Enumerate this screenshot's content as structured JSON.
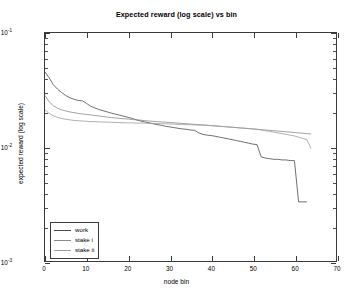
{
  "chart_data": {
    "type": "line",
    "title": "Expected reward (log scale) vs bin",
    "xlabel": "node bin",
    "ylabel": "expected reward (log scale)",
    "yscale": "log",
    "xscale": "linear",
    "xlim": [
      0,
      70
    ],
    "ylim": [
      0.001,
      0.1
    ],
    "grid": false,
    "xticks": [
      "0",
      "10",
      "20",
      "30",
      "40",
      "50",
      "60",
      "70"
    ],
    "xtick_values": [
      0,
      10,
      20,
      30,
      40,
      50,
      60,
      70
    ],
    "ytick_labels": [
      "10",
      "10",
      "10"
    ],
    "ytick_exponents": [
      "-1",
      "-2",
      "-3"
    ],
    "ytick_values": [
      0.1,
      0.01,
      0.001
    ],
    "legend_position": "lower left",
    "series": [
      {
        "name": "work",
        "color": "#4a4a4a",
        "x": [
          0,
          1,
          2,
          3,
          4,
          5,
          6,
          7,
          8,
          9,
          10,
          11,
          12,
          13,
          14,
          15,
          16,
          17,
          18,
          19,
          20,
          21,
          22,
          23,
          24,
          25,
          26,
          27,
          28,
          29,
          30,
          31,
          32,
          33,
          34,
          35,
          36,
          37,
          38,
          39,
          40,
          41,
          42,
          43,
          44,
          45,
          46,
          47,
          48,
          49,
          50,
          51,
          52,
          53,
          54,
          55,
          56,
          57,
          58,
          59,
          60,
          61,
          62,
          63
        ],
        "values": [
          0.0455,
          0.0404,
          0.0352,
          0.0322,
          0.03,
          0.0283,
          0.027,
          0.0262,
          0.0256,
          0.0254,
          0.0241,
          0.0228,
          0.022,
          0.0213,
          0.0208,
          0.0203,
          0.0198,
          0.0194,
          0.019,
          0.0186,
          0.0182,
          0.0178,
          0.0173,
          0.0169,
          0.0166,
          0.0163,
          0.016,
          0.0157,
          0.0155,
          0.0152,
          0.015,
          0.0148,
          0.0146,
          0.0144,
          0.0143,
          0.0141,
          0.014,
          0.0133,
          0.0129,
          0.0127,
          0.0126,
          0.0124,
          0.0122,
          0.012,
          0.0118,
          0.0116,
          0.0114,
          0.0112,
          0.011,
          0.0108,
          0.0106,
          0.0105,
          0.0082,
          0.008,
          0.0079,
          0.0078,
          0.0078,
          0.0077,
          0.0077,
          0.0076,
          0.0076,
          0.0033,
          0.0033,
          0.0033
        ]
      },
      {
        "name": "stake i",
        "color": "#8a8a8a",
        "x": [
          0,
          1,
          2,
          3,
          4,
          5,
          6,
          7,
          8,
          9,
          10,
          11,
          12,
          13,
          14,
          15,
          16,
          17,
          18,
          19,
          20,
          21,
          22,
          23,
          24,
          25,
          26,
          27,
          28,
          29,
          30,
          31,
          32,
          33,
          34,
          35,
          36,
          37,
          38,
          39,
          40,
          41,
          42,
          43,
          44,
          45,
          46,
          47,
          48,
          49,
          50,
          51,
          52,
          53,
          54,
          55,
          56,
          57,
          58,
          59,
          60,
          61,
          62,
          63,
          64
        ],
        "values": [
          0.0283,
          0.0249,
          0.023,
          0.0219,
          0.0212,
          0.0207,
          0.0203,
          0.02,
          0.0197,
          0.0195,
          0.0193,
          0.0191,
          0.0189,
          0.0187,
          0.0185,
          0.0183,
          0.0181,
          0.018,
          0.0178,
          0.0177,
          0.0176,
          0.0174,
          0.0173,
          0.0172,
          0.017,
          0.0169,
          0.0168,
          0.0167,
          0.0166,
          0.0165,
          0.0164,
          0.0163,
          0.0162,
          0.0161,
          0.016,
          0.0159,
          0.0158,
          0.0157,
          0.0156,
          0.0155,
          0.0154,
          0.0153,
          0.0152,
          0.0151,
          0.015,
          0.0149,
          0.0148,
          0.0147,
          0.0146,
          0.0145,
          0.0144,
          0.0143,
          0.0142,
          0.0141,
          0.014,
          0.0139,
          0.0138,
          0.0137,
          0.0136,
          0.0135,
          0.0134,
          0.0133,
          0.0132,
          0.0131,
          0.013
        ]
      },
      {
        "name": "stake ii",
        "color": "#9b9b9b",
        "x": [
          0,
          1,
          2,
          3,
          4,
          5,
          6,
          7,
          8,
          9,
          10,
          11,
          12,
          13,
          14,
          15,
          16,
          17,
          18,
          19,
          20,
          21,
          22,
          23,
          24,
          25,
          26,
          27,
          28,
          29,
          30,
          31,
          32,
          33,
          34,
          35,
          36,
          37,
          38,
          39,
          40,
          41,
          42,
          43,
          44,
          45,
          46,
          47,
          48,
          49,
          50,
          51,
          52,
          53,
          54,
          55,
          56,
          57,
          58,
          59,
          60,
          61,
          62,
          63,
          64
        ],
        "values": [
          0.0212,
          0.0197,
          0.0188,
          0.0182,
          0.0178,
          0.0175,
          0.0173,
          0.0171,
          0.017,
          0.0169,
          0.0168,
          0.0167,
          0.0167,
          0.0166,
          0.0166,
          0.0165,
          0.0165,
          0.0164,
          0.0164,
          0.0163,
          0.0163,
          0.0163,
          0.0162,
          0.0162,
          0.0162,
          0.0161,
          0.0161,
          0.0161,
          0.016,
          0.016,
          0.0159,
          0.0159,
          0.0158,
          0.0158,
          0.0157,
          0.0157,
          0.0156,
          0.0156,
          0.0155,
          0.0155,
          0.0154,
          0.0153,
          0.0152,
          0.0151,
          0.015,
          0.0149,
          0.0148,
          0.0147,
          0.0146,
          0.0145,
          0.0144,
          0.0143,
          0.0141,
          0.0139,
          0.0137,
          0.0135,
          0.0133,
          0.0131,
          0.0129,
          0.0127,
          0.0125,
          0.0122,
          0.0119,
          0.0116,
          0.0097
        ]
      }
    ],
    "legend": [
      "work",
      "stake i",
      "stake ii"
    ]
  },
  "figure": {
    "axis_color": "#3a3a3a",
    "background": "#ffffff"
  }
}
